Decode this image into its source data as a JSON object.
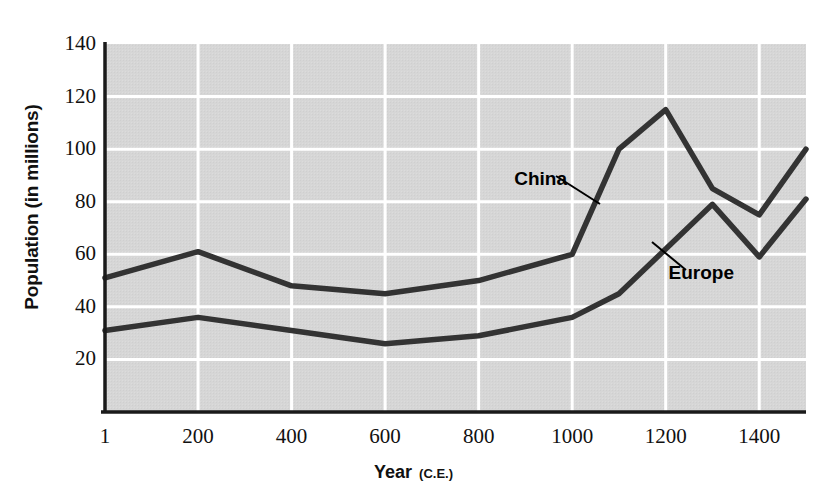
{
  "chart_data": {
    "type": "line",
    "title": "",
    "xlabel": "Year",
    "xlabel_suffix": "(C.E.)",
    "ylabel": "Population (in millions)",
    "xlim": [
      1,
      1500
    ],
    "ylim": [
      0,
      140
    ],
    "grid": true,
    "legend_position": "inline-annotations",
    "xticks": [
      "1",
      "200",
      "400",
      "600",
      "800",
      "1000",
      "1200",
      "1400"
    ],
    "xtick_values": [
      1,
      200,
      400,
      600,
      800,
      1000,
      1200,
      1400
    ],
    "yticks": [
      "20",
      "40",
      "60",
      "80",
      "100",
      "120",
      "140"
    ],
    "ytick_values": [
      20,
      40,
      60,
      80,
      100,
      120,
      140
    ],
    "x": [
      1,
      200,
      400,
      600,
      800,
      1000,
      1100,
      1200,
      1300,
      1400,
      1500
    ],
    "series": [
      {
        "name": "China",
        "color": "#333333",
        "values": [
          51,
          61,
          48,
          45,
          50,
          60,
          100,
          115,
          85,
          75,
          100
        ]
      },
      {
        "name": "Europe",
        "color": "#333333",
        "values": [
          31,
          36,
          31,
          26,
          29,
          36,
          45,
          62,
          79,
          59,
          81
        ]
      }
    ],
    "annotations": [
      {
        "text": "China",
        "x": 1000,
        "y": 88
      },
      {
        "text": "Europe",
        "x": 1330,
        "y": 52
      }
    ],
    "plot_bg": "#d6d6d6",
    "gridline_color": "#ffffff",
    "axis_color": "#1a1a1a"
  }
}
